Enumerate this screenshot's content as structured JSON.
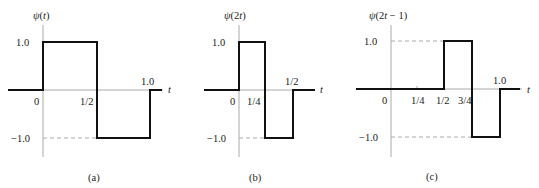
{
  "chart_data": [
    {
      "type": "line",
      "panel_label": "(a)",
      "title": "ψ(t)",
      "xlabel": "t",
      "ylabel": "ψ(t)",
      "x_ticks": [
        "0",
        "1/2",
        "1.0"
      ],
      "y_ticks": [
        "1.0",
        "−1.0"
      ],
      "step": true,
      "x": [
        -0.75,
        0,
        0,
        0.5,
        0.5,
        1.0,
        1.0,
        1.25
      ],
      "y": [
        0,
        0,
        1,
        1,
        -1,
        -1,
        0,
        0
      ],
      "ylim": [
        -1.5,
        1.5
      ],
      "grid": false
    },
    {
      "type": "line",
      "panel_label": "(b)",
      "title": "ψ(2t)",
      "xlabel": "t",
      "ylabel": "ψ(2t)",
      "x_ticks": [
        "0",
        "1/4",
        "1/2"
      ],
      "y_ticks": [
        "1.0",
        "−1.0"
      ],
      "step": true,
      "x": [
        -0.6,
        0,
        0,
        0.25,
        0.25,
        0.5,
        0.5,
        0.75
      ],
      "y": [
        0,
        0,
        1,
        1,
        -1,
        -1,
        0,
        0
      ],
      "ylim": [
        -1.5,
        1.5
      ],
      "grid": false
    },
    {
      "type": "line",
      "panel_label": "(c)",
      "title": "ψ(2t − 1)",
      "xlabel": "t",
      "ylabel": "ψ(2t − 1)",
      "x_ticks": [
        "0",
        "1/4",
        "1/2",
        "3/4",
        "1.0"
      ],
      "y_ticks": [
        "1.0",
        "−1.0"
      ],
      "step": true,
      "x": [
        -0.33,
        0,
        0.5,
        0.5,
        0.75,
        0.75,
        1.0,
        1.0,
        1.2
      ],
      "y": [
        0,
        0,
        0,
        1,
        1,
        -1,
        -1,
        0,
        0
      ],
      "ylim": [
        -1.5,
        1.5
      ],
      "grid": false
    }
  ],
  "panels": {
    "a": {
      "ylabel": "ψ(t)",
      "t": "t",
      "y_pos": "1.0",
      "y_neg": "−1.0",
      "x0": "0",
      "xhalf": "1/2",
      "x1": "1.0",
      "caption": "(a)"
    },
    "b": {
      "ylabel": "ψ(2t)",
      "t": "t",
      "y_pos": "1.0",
      "y_neg": "−1.0",
      "x0": "0",
      "xquarter": "1/4",
      "xhalf": "1/2",
      "caption": "(b)"
    },
    "c": {
      "ylabel": "ψ(2t − 1)",
      "t": "t",
      "y_pos": "1.0",
      "y_neg": "−1.0",
      "x0": "0",
      "xquarter": "1/4",
      "xhalf": "1/2",
      "x3q": "3/4",
      "x1": "1.0",
      "caption": "(c)"
    }
  }
}
